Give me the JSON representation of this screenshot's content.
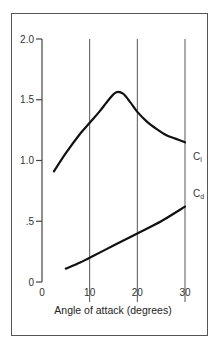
{
  "chart_data": {
    "type": "line",
    "title": "",
    "xlabel": "Angle of attack (degrees)",
    "ylabel": "",
    "xlim": [
      0,
      30
    ],
    "ylim": [
      0,
      2.0
    ],
    "x_ticks": [
      "0",
      "10",
      "20",
      "30"
    ],
    "y_ticks": [
      "0",
      ".5",
      "1.0",
      "1.5",
      "2.0"
    ],
    "vertical_gridlines_at": [
      10,
      20,
      30
    ],
    "series": [
      {
        "name": "Cl",
        "label_main": "C",
        "label_sub": "l",
        "x": [
          2.5,
          5,
          8,
          10,
          12,
          14,
          15.5,
          17,
          18.5,
          20,
          22,
          24,
          26,
          28,
          30
        ],
        "y": [
          0.91,
          1.06,
          1.22,
          1.31,
          1.4,
          1.5,
          1.56,
          1.55,
          1.48,
          1.4,
          1.32,
          1.26,
          1.21,
          1.18,
          1.15
        ]
      },
      {
        "name": "Cd",
        "label_main": "C",
        "label_sub": "d",
        "x": [
          5,
          8,
          10,
          15,
          20,
          25,
          30
        ],
        "y": [
          0.11,
          0.16,
          0.2,
          0.3,
          0.4,
          0.5,
          0.62
        ]
      }
    ]
  }
}
